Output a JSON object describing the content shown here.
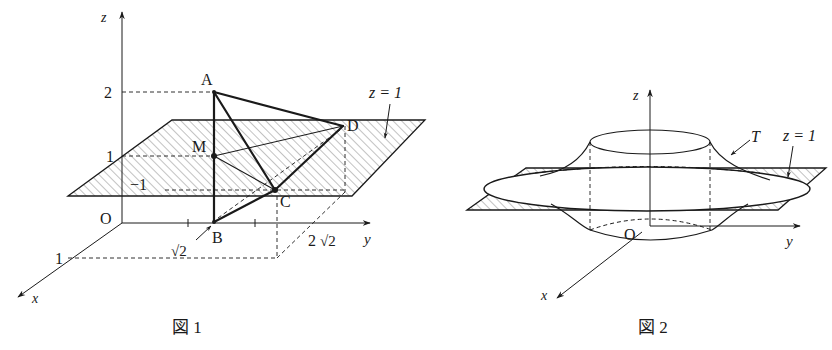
{
  "figure1": {
    "caption": "図 1",
    "axes": {
      "x": "x",
      "y": "y",
      "z": "z",
      "origin": "O"
    },
    "ticks": {
      "z2": "2",
      "z1": "1",
      "x1": "1",
      "xneg1": "−1",
      "y_sqrt2": "√2",
      "y_2sqrt2_coef": "2",
      "y_2sqrt2_root": "√2"
    },
    "points": {
      "A": "A",
      "B": "B",
      "C": "C",
      "D": "D",
      "M": "M"
    },
    "plane_label": "z = 1"
  },
  "figure2": {
    "caption": "図 2",
    "axes": {
      "x": "x",
      "y": "y",
      "z": "z",
      "origin": "O"
    },
    "solid_label": "T",
    "plane_label": "z = 1"
  },
  "colors": {
    "ink": "#1a1a1a",
    "hatch": "#555555",
    "background": "#ffffff"
  }
}
